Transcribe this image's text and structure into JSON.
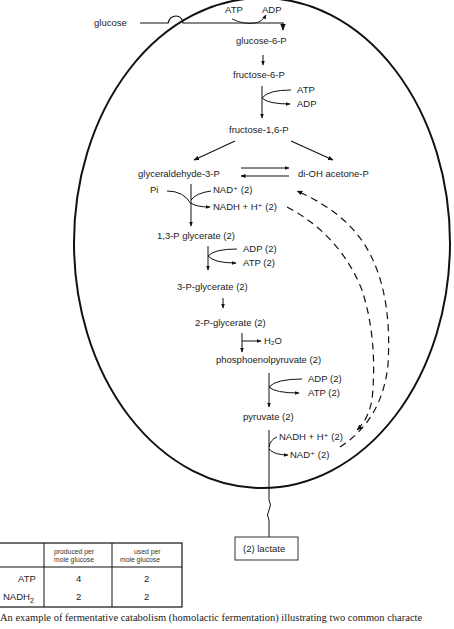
{
  "diagram": {
    "cell_boundary": "cell-membrane-oval",
    "external": {
      "input": "glucose",
      "output": "(2) lactate"
    },
    "pathway": {
      "glucose6p": "glucose-6-P",
      "fructose6p": "fructose-6-P",
      "fructose16p": "fructose-1,6-P",
      "g3p": "glyceraldehyde-3-P",
      "dhap": "di-OH acetone-P",
      "bpg13": "1,3-P glycerate (2)",
      "pg3": "3-P-glycerate (2)",
      "pg2": "2-P-glycerate (2)",
      "pep": "phosphoenolpyruvate (2)",
      "pyruvate": "pyruvate (2)"
    },
    "cofactors": {
      "step1_in": "ATP",
      "step1_out": "ADP",
      "step3_in": "ATP",
      "step3_out": "ADP",
      "g3p_pi": "Pi",
      "g3p_nad": "NAD⁺ (2)",
      "g3p_nadh": "NADH + H⁺ (2)",
      "bpg_adp": "ADP (2)",
      "bpg_atp": "ATP (2)",
      "pg2_water": "H₂O",
      "pep_adp": "ADP (2)",
      "pep_atp": "ATP (2)",
      "pyr_nadh": "NADH + H⁺ (2)",
      "pyr_nad": "NAD⁺ (2)"
    }
  },
  "table": {
    "headers": [
      "",
      "produced per mole glucose",
      "used per mole glucose"
    ],
    "header_line1": [
      "produced per",
      "used per"
    ],
    "header_line2": [
      "mole glucose",
      "mole glucose"
    ],
    "rows": [
      {
        "label": "ATP",
        "produced": "4",
        "used": "2"
      },
      {
        "label": "NADH",
        "label_sub": "2",
        "produced": "2",
        "used": "2"
      }
    ]
  },
  "caption": "An example of fermentative catabolism (homolactic fermentation) illustrating two common characte"
}
